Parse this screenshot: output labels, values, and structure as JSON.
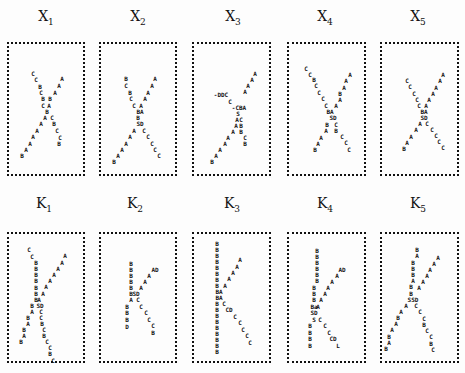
{
  "panels": [
    {
      "id": "X1",
      "letter": "X",
      "sub": "1",
      "tx": 46,
      "ty": 8,
      "box": {
        "x": 7,
        "y": 42,
        "w": 78,
        "h": 134
      },
      "glyphs": [
        [
          "C",
          33,
          74
        ],
        [
          "C",
          36,
          80
        ],
        [
          "B",
          40,
          87
        ],
        [
          "C",
          41,
          93
        ],
        [
          "B",
          43,
          99
        ],
        [
          "C",
          43,
          106
        ],
        [
          "B",
          47,
          112
        ],
        [
          "C",
          52,
          118
        ],
        [
          "B",
          54,
          124
        ],
        [
          "C",
          57,
          131
        ],
        [
          "C",
          60,
          138
        ],
        [
          "B",
          59,
          144
        ],
        [
          "A",
          62,
          79
        ],
        [
          "A",
          59,
          86
        ],
        [
          "A",
          55,
          93
        ],
        [
          "B",
          50,
          99
        ],
        [
          "A",
          49,
          106
        ],
        [
          "A",
          45,
          118
        ],
        [
          "A",
          41,
          124
        ],
        [
          "A",
          37,
          131
        ],
        [
          "A",
          33,
          137
        ],
        [
          "A",
          30,
          144
        ],
        [
          "A",
          26,
          150
        ],
        [
          "B",
          22,
          156
        ]
      ]
    },
    {
      "id": "X2",
      "letter": "X",
      "sub": "2",
      "tx": 138,
      "ty": 8,
      "box": {
        "x": 99,
        "y": 42,
        "w": 78,
        "h": 134
      },
      "glyphs": [
        [
          "B",
          126,
          79
        ],
        [
          "C",
          126,
          86
        ],
        [
          "B",
          130,
          93
        ],
        [
          "C",
          131,
          99
        ],
        [
          "C",
          134,
          106
        ],
        [
          "BA",
          140,
          112
        ],
        [
          "B",
          138,
          118
        ],
        [
          "SD",
          140,
          124
        ],
        [
          "C",
          144,
          131
        ],
        [
          "C",
          148,
          137
        ],
        [
          "C",
          152,
          144
        ],
        [
          "C",
          155,
          150
        ],
        [
          "C",
          159,
          156
        ],
        [
          "A",
          155,
          79
        ],
        [
          "A",
          152,
          86
        ],
        [
          "A",
          148,
          93
        ],
        [
          "A",
          145,
          99
        ],
        [
          "A",
          141,
          106
        ],
        [
          "A",
          134,
          131
        ],
        [
          "A",
          130,
          137
        ],
        [
          "A",
          126,
          144
        ],
        [
          "A",
          122,
          150
        ],
        [
          "A",
          118,
          156
        ],
        [
          "B",
          114,
          162
        ]
      ]
    },
    {
      "id": "X3",
      "letter": "X",
      "sub": "3",
      "tx": 233,
      "ty": 8,
      "box": {
        "x": 192,
        "y": 42,
        "w": 79,
        "h": 134
      },
      "glyphs": [
        [
          "-DDC",
          221,
          95
        ],
        [
          "C",
          230,
          102
        ],
        [
          "-CBA",
          239,
          108
        ],
        [
          "S",
          238,
          114
        ],
        [
          "A",
          237,
          120
        ],
        [
          "C",
          241,
          120
        ],
        [
          "B",
          241,
          126
        ],
        [
          "B",
          241,
          132
        ],
        [
          "C",
          245,
          138
        ],
        [
          "B",
          245,
          144
        ],
        [
          "A",
          255,
          74
        ],
        [
          "A",
          252,
          80
        ],
        [
          "A",
          248,
          86
        ],
        [
          "A",
          245,
          92
        ],
        [
          "A",
          236,
          126
        ],
        [
          "A",
          233,
          132
        ],
        [
          "A",
          228,
          138
        ],
        [
          "A",
          225,
          144
        ],
        [
          "A",
          220,
          150
        ],
        [
          "A",
          216,
          156
        ],
        [
          "B",
          212,
          162
        ]
      ]
    },
    {
      "id": "X4",
      "letter": "X",
      "sub": "4",
      "tx": 325,
      "ty": 8,
      "box": {
        "x": 287,
        "y": 42,
        "w": 79,
        "h": 134
      },
      "glyphs": [
        [
          "C",
          306,
          69
        ],
        [
          "C",
          310,
          75
        ],
        [
          "B",
          314,
          80
        ],
        [
          "C",
          316,
          86
        ],
        [
          "C",
          319,
          93
        ],
        [
          "C",
          323,
          99
        ],
        [
          "C",
          326,
          106
        ],
        [
          "BA",
          330,
          112
        ],
        [
          "SD",
          333,
          118
        ],
        [
          "C",
          336,
          125
        ],
        [
          "B",
          336,
          131
        ],
        [
          "C",
          342,
          137
        ],
        [
          "C",
          346,
          143
        ],
        [
          "C",
          349,
          150
        ],
        [
          "A",
          350,
          75
        ],
        [
          "A",
          346,
          81
        ],
        [
          "A",
          344,
          88
        ],
        [
          "B",
          340,
          94
        ],
        [
          "A",
          340,
          100
        ],
        [
          "A",
          336,
          106
        ],
        [
          "B",
          327,
          125
        ],
        [
          "A",
          326,
          131
        ],
        [
          "A",
          321,
          138
        ],
        [
          "A",
          318,
          144
        ],
        [
          "B",
          315,
          150
        ]
      ]
    },
    {
      "id": "X5",
      "letter": "X",
      "sub": "5",
      "tx": 418,
      "ty": 8,
      "box": {
        "x": 380,
        "y": 42,
        "w": 79,
        "h": 134
      },
      "glyphs": [
        [
          "C",
          407,
          81
        ],
        [
          "C",
          410,
          87
        ],
        [
          "C",
          414,
          94
        ],
        [
          "C",
          417,
          100
        ],
        [
          "C",
          419,
          106
        ],
        [
          "BA",
          424,
          112
        ],
        [
          "SD",
          424,
          118
        ],
        [
          "C",
          427,
          124
        ],
        [
          "C",
          432,
          130
        ],
        [
          "C",
          436,
          136
        ],
        [
          "C",
          439,
          142
        ],
        [
          "C",
          443,
          148
        ],
        [
          "A",
          443,
          75
        ],
        [
          "A",
          440,
          81
        ],
        [
          "A",
          436,
          88
        ],
        [
          "A",
          433,
          94
        ],
        [
          "A",
          429,
          100
        ],
        [
          "A",
          426,
          106
        ],
        [
          "A",
          420,
          124
        ],
        [
          "A",
          416,
          130
        ],
        [
          "A",
          411,
          137
        ],
        [
          "A",
          407,
          143
        ],
        [
          "B",
          404,
          149
        ]
      ]
    },
    {
      "id": "K1",
      "letter": "K",
      "sub": "1",
      "tx": 44,
      "ty": 195,
      "box": {
        "x": 7,
        "y": 232,
        "w": 78,
        "h": 131
      },
      "glyphs": [
        [
          "C",
          29,
          250
        ],
        [
          "C",
          32,
          257
        ],
        [
          "B",
          36,
          263
        ],
        [
          "B",
          36,
          269
        ],
        [
          "B",
          36,
          275
        ],
        [
          "B",
          36,
          281
        ],
        [
          "B",
          36,
          288
        ],
        [
          "B",
          36,
          294
        ],
        [
          "B",
          36,
          300
        ],
        [
          "SD",
          40,
          306
        ],
        [
          "C",
          41,
          312
        ],
        [
          "C",
          41,
          318
        ],
        [
          "B",
          42,
          324
        ],
        [
          "C",
          44,
          330
        ],
        [
          "B",
          44,
          336
        ],
        [
          "C",
          47,
          342
        ],
        [
          "C",
          50,
          348
        ],
        [
          "B",
          50,
          354
        ],
        [
          "C",
          53,
          361
        ],
        [
          "A",
          65,
          256
        ],
        [
          "A",
          62,
          263
        ],
        [
          "A",
          58,
          269
        ],
        [
          "A",
          54,
          275
        ],
        [
          "A",
          50,
          281
        ],
        [
          "A",
          46,
          287
        ],
        [
          "A",
          43,
          294
        ],
        [
          "A",
          39,
          300
        ],
        [
          "B",
          32,
          306
        ],
        [
          "A",
          32,
          312
        ],
        [
          "B",
          28,
          318
        ],
        [
          "A",
          28,
          324
        ],
        [
          "B",
          24,
          330
        ],
        [
          "A",
          24,
          336
        ],
        [
          "B",
          21,
          342
        ]
      ]
    },
    {
      "id": "K2",
      "letter": "K",
      "sub": "2",
      "tx": 135,
      "ty": 195,
      "box": {
        "x": 99,
        "y": 232,
        "w": 78,
        "h": 131
      },
      "glyphs": [
        [
          "B",
          131,
          264
        ],
        [
          "B",
          131,
          270
        ],
        [
          "B",
          131,
          276
        ],
        [
          "B",
          131,
          282
        ],
        [
          "B",
          131,
          288
        ],
        [
          "B",
          131,
          294
        ],
        [
          "SD",
          136,
          294
        ],
        [
          "A",
          131,
          300
        ],
        [
          "C",
          138,
          300
        ],
        [
          "C",
          141,
          307
        ],
        [
          "C",
          146,
          313
        ],
        [
          "C",
          149,
          320
        ],
        [
          "C",
          153,
          326
        ],
        [
          "B",
          153,
          333
        ],
        [
          "AD",
          155,
          270
        ],
        [
          "A",
          149,
          276
        ],
        [
          "A",
          145,
          282
        ],
        [
          "A",
          141,
          288
        ],
        [
          "B",
          127,
          307
        ],
        [
          "B",
          127,
          313
        ],
        [
          "B",
          127,
          320
        ],
        [
          "D",
          127,
          327
        ]
      ]
    },
    {
      "id": "K3",
      "letter": "K",
      "sub": "3",
      "tx": 232,
      "ty": 195,
      "box": {
        "x": 192,
        "y": 232,
        "w": 79,
        "h": 131
      },
      "glyphs": [
        [
          "B",
          217,
          244
        ],
        [
          "B",
          217,
          250
        ],
        [
          "B",
          217,
          256
        ],
        [
          "B",
          217,
          262
        ],
        [
          "B",
          217,
          268
        ],
        [
          "B",
          217,
          274
        ],
        [
          "B",
          217,
          280
        ],
        [
          "B",
          217,
          286
        ],
        [
          "BA",
          219,
          292
        ],
        [
          "BA",
          219,
          298
        ],
        [
          "B",
          217,
          304
        ],
        [
          "B",
          217,
          310
        ],
        [
          "B",
          217,
          316
        ],
        [
          "B",
          217,
          322
        ],
        [
          "B",
          217,
          328
        ],
        [
          "B",
          217,
          334
        ],
        [
          "B",
          217,
          340
        ],
        [
          "B",
          217,
          346
        ],
        [
          "B",
          217,
          352
        ],
        [
          "A",
          240,
          260
        ],
        [
          "A",
          237,
          267
        ],
        [
          "A",
          233,
          273
        ],
        [
          "A",
          229,
          279
        ],
        [
          "A",
          225,
          286
        ],
        [
          "C",
          224,
          304
        ],
        [
          "CD",
          229,
          310
        ],
        [
          "C",
          235,
          317
        ],
        [
          "C",
          240,
          323
        ],
        [
          "C",
          243,
          330
        ],
        [
          "C",
          247,
          336
        ],
        [
          "C",
          250,
          343
        ]
      ]
    },
    {
      "id": "K4",
      "letter": "K",
      "sub": "4",
      "tx": 325,
      "ty": 195,
      "box": {
        "x": 287,
        "y": 232,
        "w": 79,
        "h": 131
      },
      "glyphs": [
        [
          "B",
          317,
          251
        ],
        [
          "B",
          317,
          257
        ],
        [
          "B",
          317,
          263
        ],
        [
          "B",
          317,
          269
        ],
        [
          "B",
          317,
          275
        ],
        [
          "B",
          317,
          281
        ],
        [
          "B",
          314,
          288
        ],
        [
          "B",
          314,
          294
        ],
        [
          "B",
          314,
          300
        ],
        [
          "Ba",
          314,
          307
        ],
        [
          "SD",
          314,
          313
        ],
        [
          "S",
          314,
          320
        ],
        [
          "C",
          320,
          320
        ],
        [
          "C",
          325,
          326
        ],
        [
          "C",
          329,
          333
        ],
        [
          "CD",
          333,
          339
        ],
        [
          "L",
          338,
          346
        ],
        [
          "B",
          310,
          326
        ],
        [
          "B",
          310,
          333
        ],
        [
          "B",
          310,
          339
        ],
        [
          "B",
          310,
          346
        ],
        [
          "AD",
          342,
          270
        ],
        [
          "A",
          337,
          276
        ],
        [
          "A",
          332,
          282
        ],
        [
          "A",
          328,
          288
        ],
        [
          "A",
          325,
          294
        ],
        [
          "A",
          321,
          300
        ],
        [
          "A",
          318,
          307
        ]
      ]
    },
    {
      "id": "K5",
      "letter": "K",
      "sub": "5",
      "tx": 418,
      "ty": 195,
      "box": {
        "x": 380,
        "y": 232,
        "w": 79,
        "h": 131
      },
      "glyphs": [
        [
          "B",
          417,
          250
        ],
        [
          "A",
          417,
          256
        ],
        [
          "B",
          413,
          263
        ],
        [
          "B",
          413,
          269
        ],
        [
          "B",
          413,
          275
        ],
        [
          "A",
          413,
          281
        ],
        [
          "B",
          411,
          287
        ],
        [
          "B",
          411,
          294
        ],
        [
          "SSD",
          413,
          300
        ],
        [
          "C",
          416,
          306
        ],
        [
          "C",
          420,
          312
        ],
        [
          "C",
          424,
          319
        ],
        [
          "B",
          424,
          325
        ],
        [
          "C",
          427,
          331
        ],
        [
          "C",
          431,
          337
        ],
        [
          "B",
          431,
          344
        ],
        [
          "C",
          433,
          350
        ],
        [
          "A",
          438,
          258
        ],
        [
          "A",
          434,
          264
        ],
        [
          "A",
          430,
          270
        ],
        [
          "A",
          427,
          276
        ],
        [
          "A",
          423,
          282
        ],
        [
          "A",
          419,
          288
        ],
        [
          "A",
          406,
          306
        ],
        [
          "A",
          401,
          312
        ],
        [
          "B",
          398,
          318
        ],
        [
          "A",
          396,
          324
        ],
        [
          "A",
          392,
          330
        ],
        [
          "B",
          389,
          337
        ],
        [
          "A",
          389,
          343
        ],
        [
          "B",
          386,
          349
        ]
      ]
    }
  ]
}
